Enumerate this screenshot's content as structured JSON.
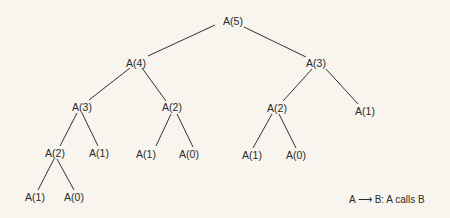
{
  "diagram": {
    "type": "recursion-call-tree",
    "nodes": [
      {
        "id": "n0",
        "label": "A(5)",
        "x": 233,
        "y": 21
      },
      {
        "id": "n1",
        "label": "A(4)",
        "x": 136,
        "y": 63
      },
      {
        "id": "n2",
        "label": "A(3)",
        "x": 316,
        "y": 63
      },
      {
        "id": "n3",
        "label": "A(3)",
        "x": 82,
        "y": 107
      },
      {
        "id": "n4",
        "label": "A(2)",
        "x": 172,
        "y": 107
      },
      {
        "id": "n5",
        "label": "A(2)",
        "x": 277,
        "y": 108
      },
      {
        "id": "n6",
        "label": "A(1)",
        "x": 365,
        "y": 111
      },
      {
        "id": "n7",
        "label": "A(2)",
        "x": 55,
        "y": 153
      },
      {
        "id": "n8",
        "label": "A(1)",
        "x": 99,
        "y": 153
      },
      {
        "id": "n9",
        "label": "A(1)",
        "x": 146,
        "y": 154
      },
      {
        "id": "n10",
        "label": "A(0)",
        "x": 189,
        "y": 154
      },
      {
        "id": "n11",
        "label": "A(1)",
        "x": 252,
        "y": 155
      },
      {
        "id": "n12",
        "label": "A(0)",
        "x": 296,
        "y": 155
      },
      {
        "id": "n13",
        "label": "A(1)",
        "x": 35,
        "y": 197
      },
      {
        "id": "n14",
        "label": "A(0)",
        "x": 74,
        "y": 197
      }
    ],
    "edges": [
      {
        "from": "n0",
        "to": "n1",
        "x1": 215,
        "y1": 25,
        "x2": 148,
        "y2": 56
      },
      {
        "from": "n0",
        "to": "n2",
        "x1": 244,
        "y1": 27,
        "x2": 306,
        "y2": 57
      },
      {
        "from": "n1",
        "to": "n3",
        "x1": 130,
        "y1": 68,
        "x2": 89,
        "y2": 100
      },
      {
        "from": "n1",
        "to": "n4",
        "x1": 142,
        "y1": 68,
        "x2": 166,
        "y2": 101
      },
      {
        "from": "n2",
        "to": "n5",
        "x1": 312,
        "y1": 69,
        "x2": 283,
        "y2": 101
      },
      {
        "from": "n2",
        "to": "n6",
        "x1": 326,
        "y1": 69,
        "x2": 358,
        "y2": 104
      },
      {
        "from": "n3",
        "to": "n7",
        "x1": 77,
        "y1": 113,
        "x2": 60,
        "y2": 146
      },
      {
        "from": "n3",
        "to": "n8",
        "x1": 82,
        "y1": 113,
        "x2": 98,
        "y2": 146
      },
      {
        "from": "n4",
        "to": "n9",
        "x1": 171,
        "y1": 114,
        "x2": 156,
        "y2": 146
      },
      {
        "from": "n4",
        "to": "n10",
        "x1": 177,
        "y1": 114,
        "x2": 193,
        "y2": 147
      },
      {
        "from": "n5",
        "to": "n11",
        "x1": 272,
        "y1": 114,
        "x2": 253,
        "y2": 148
      },
      {
        "from": "n5",
        "to": "n12",
        "x1": 279,
        "y1": 114,
        "x2": 296,
        "y2": 148
      },
      {
        "from": "n7",
        "to": "n13",
        "x1": 54,
        "y1": 159,
        "x2": 38,
        "y2": 190
      },
      {
        "from": "n7",
        "to": "n14",
        "x1": 57,
        "y1": 159,
        "x2": 74,
        "y2": 190
      }
    ]
  },
  "legend": {
    "from": "A",
    "arrow": "⟶",
    "to": "B",
    "desc": ": A calls B"
  }
}
